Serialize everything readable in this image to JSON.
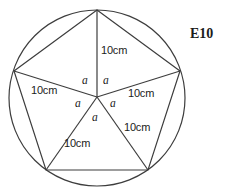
{
  "figure": {
    "tag": "E10",
    "circle": {
      "cx": 97,
      "cy": 98,
      "r": 88,
      "stroke": "#3d3d3d"
    },
    "center_vertex": {
      "x": 97,
      "y": 97
    },
    "pentagon_vertices": [
      {
        "name": "top",
        "x": 97,
        "y": 10
      },
      {
        "name": "upper-right",
        "x": 180,
        "y": 71
      },
      {
        "name": "lower-right",
        "x": 148,
        "y": 170
      },
      {
        "name": "lower-left",
        "x": 46,
        "y": 170
      },
      {
        "name": "upper-left",
        "x": 14,
        "y": 71
      }
    ],
    "side_labels": [
      {
        "id": "side-top-right",
        "text": "10cm",
        "x": 101,
        "y": 45
      },
      {
        "id": "side-left",
        "text": "10cm",
        "x": 31,
        "y": 85
      },
      {
        "id": "side-right",
        "text": "10cm",
        "x": 128,
        "y": 88
      },
      {
        "id": "side-lower-right",
        "text": "10cm",
        "x": 124,
        "y": 122
      },
      {
        "id": "side-bottom",
        "text": "10cm",
        "x": 64,
        "y": 138
      }
    ],
    "angle_labels": [
      {
        "id": "angle-upper-left",
        "text": "a",
        "x": 82,
        "y": 75
      },
      {
        "id": "angle-upper-right",
        "text": "a",
        "x": 103,
        "y": 75
      },
      {
        "id": "angle-left",
        "text": "a",
        "x": 75,
        "y": 98
      },
      {
        "id": "angle-right",
        "text": "a",
        "x": 110,
        "y": 98
      },
      {
        "id": "angle-bottom",
        "text": "a",
        "x": 92,
        "y": 112
      }
    ]
  }
}
